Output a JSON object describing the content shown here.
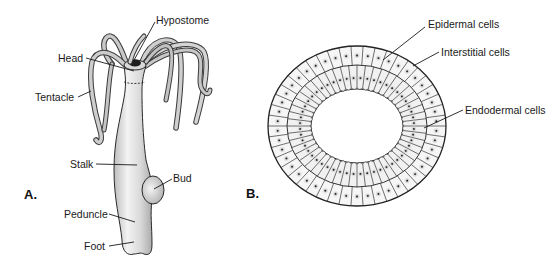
{
  "figure": {
    "panel_a": {
      "label": "A.",
      "subject": "Hydra body",
      "labels": {
        "hypostome": "Hypostome",
        "head": "Head",
        "tentacle": "Tentacle",
        "stalk": "Stalk",
        "bud": "Bud",
        "peduncle": "Peduncle",
        "foot": "Foot"
      }
    },
    "panel_b": {
      "label": "B.",
      "subject": "Cross-section of body wall",
      "labels": {
        "epidermal": "Epidermal cells",
        "interstitial": "Interstitial cells",
        "endodermal": "Endodermal cells"
      }
    },
    "colors": {
      "body_fill": "#d6d6d6",
      "body_highlight": "#f2f2f2",
      "outline": "#2a2a2a",
      "cell_fill": "#f4f4f4",
      "nucleus_halo": "#b8b8b8",
      "nucleus": "#2a2a2a",
      "text": "#1a1a1a"
    }
  }
}
